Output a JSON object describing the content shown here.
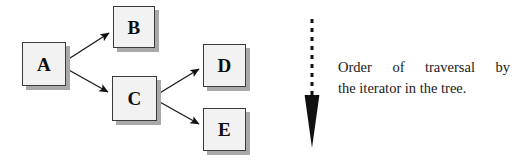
{
  "figure": {
    "kind": "tree-traversal-diagram",
    "background_color": "#ffffff",
    "node_fill_color": "#f2f2f2",
    "node_border_color": "#3a3a3a",
    "node_shadow_color": "#a9a9a9",
    "ink_color": "#0d0d0d"
  },
  "nodes": [
    {
      "id": "A",
      "label": "A",
      "x": 22,
      "y": 42,
      "w": 44,
      "h": 44
    },
    {
      "id": "B",
      "label": "B",
      "x": 113,
      "y": 6,
      "w": 42,
      "h": 42
    },
    {
      "id": "C",
      "label": "C",
      "x": 112,
      "y": 76,
      "w": 45,
      "h": 45
    },
    {
      "id": "D",
      "label": "D",
      "x": 203,
      "y": 44,
      "w": 43,
      "h": 43
    },
    {
      "id": "E",
      "label": "E",
      "x": 203,
      "y": 108,
      "w": 43,
      "h": 43
    }
  ],
  "edges": [
    {
      "id": "a-to-b",
      "from": "A",
      "to": "B",
      "style": "solid",
      "x1": 67,
      "y1": 60,
      "x2": 112,
      "y2": 31
    },
    {
      "id": "a-to-c",
      "from": "A",
      "to": "C",
      "style": "solid",
      "x1": 67,
      "y1": 69,
      "x2": 111,
      "y2": 94
    },
    {
      "id": "c-to-d",
      "from": "C",
      "to": "D",
      "style": "solid",
      "x1": 158,
      "y1": 94,
      "x2": 202,
      "y2": 67
    },
    {
      "id": "c-to-e",
      "from": "C",
      "to": "E",
      "style": "solid",
      "x1": 158,
      "y1": 101,
      "x2": 202,
      "y2": 126
    }
  ],
  "traversal_arrow": {
    "id": "traversal-direction-arrow",
    "direction": "down",
    "line_style": "dashed",
    "color": "#111111",
    "x": 312,
    "line_top": 19,
    "line_bottom": 96,
    "head_top": 96,
    "head_bottom": 148,
    "head_half_width": 7,
    "dash_length": 4,
    "dash_gap": 5,
    "line_width": 3
  },
  "caption": {
    "line1_words": [
      "Order",
      "of",
      "traversal",
      "by"
    ],
    "line2": "the iterator in the tree.",
    "full_text": "Order of traversal by the iterator in the tree."
  }
}
